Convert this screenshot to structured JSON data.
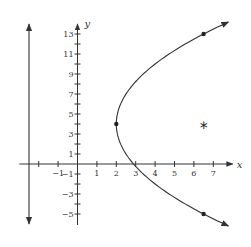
{
  "chart_data": {
    "type": "line",
    "title": "",
    "xlabel": "x",
    "ylabel": "y",
    "xlim": [
      -3,
      8
    ],
    "ylim": [
      -6,
      14
    ],
    "x_ticks": [
      -2,
      -1,
      1,
      2,
      3,
      4,
      5,
      6,
      7
    ],
    "x_tick_labels": [
      {
        "value": -1,
        "label": "−1"
      },
      {
        "value": 1,
        "label": "1"
      },
      {
        "value": 2,
        "label": "2"
      },
      {
        "value": 3,
        "label": "3"
      },
      {
        "value": 4,
        "label": "4"
      },
      {
        "value": 5,
        "label": "5"
      },
      {
        "value": 6,
        "label": "6"
      },
      {
        "value": 7,
        "label": "7"
      }
    ],
    "y_ticks": [
      -5,
      -4,
      -3,
      -2,
      -1,
      1,
      2,
      3,
      4,
      5,
      6,
      7,
      8,
      9,
      10,
      11,
      12,
      13
    ],
    "y_tick_labels": [
      {
        "value": -5,
        "label": "−5"
      },
      {
        "value": -3,
        "label": "−3"
      },
      {
        "value": -1,
        "label": "−1"
      },
      {
        "value": 1,
        "label": "1"
      },
      {
        "value": 3,
        "label": "3"
      },
      {
        "value": 5,
        "label": "5"
      },
      {
        "value": 7,
        "label": "7"
      },
      {
        "value": 9,
        "label": "9"
      },
      {
        "value": 11,
        "label": "11"
      },
      {
        "value": 13,
        "label": "13"
      }
    ],
    "grid": false,
    "series": [
      {
        "name": "parabola",
        "equation": "(y-4)^2 = 18(x-2)",
        "vertex": [
          2,
          4
        ],
        "y_range": [
          -6.2,
          14.2
        ],
        "arrows_both_ends": true
      },
      {
        "name": "directrix",
        "equation": "x = -2.5",
        "y_range": [
          -6,
          14
        ],
        "arrows_both_ends": true
      }
    ],
    "points": [
      {
        "name": "vertex",
        "x": 2,
        "y": 4,
        "marker": "dot"
      },
      {
        "name": "upper-point",
        "x": 6.5,
        "y": 13,
        "marker": "dot"
      },
      {
        "name": "lower-point",
        "x": 6.5,
        "y": -5,
        "marker": "dot"
      },
      {
        "name": "focus",
        "x": 6.5,
        "y": 4,
        "marker": "star",
        "symbol": "∗"
      }
    ]
  }
}
